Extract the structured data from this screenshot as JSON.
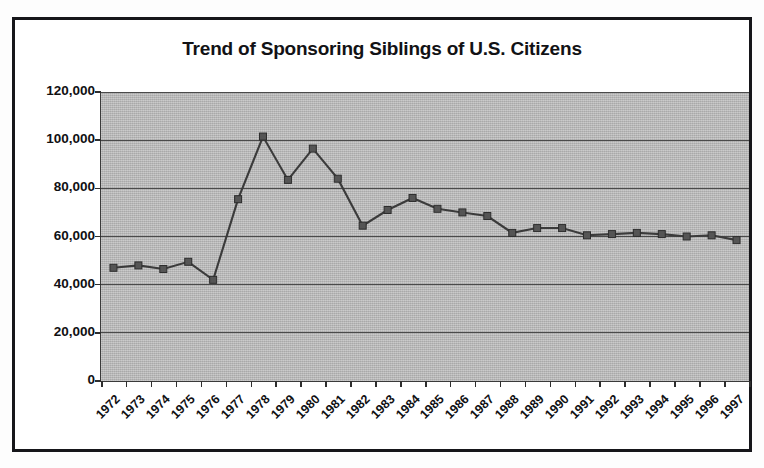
{
  "figure": {
    "title": "Trend of Sponsoring Siblings of U.S. Citizens"
  },
  "axes": {
    "y_tick_labels": [
      "120,000",
      "100,000",
      "80,000",
      "60,000",
      "40,000",
      "20,000",
      "0"
    ],
    "x_tick_labels": [
      "1972",
      "1973",
      "1974",
      "1975",
      "1976",
      "1977",
      "1978",
      "1979",
      "1980",
      "1981",
      "1982",
      "1983",
      "1984",
      "1985",
      "1986",
      "1987",
      "1988",
      "1989",
      "1990",
      "1991",
      "1992",
      "1993",
      "1994",
      "1995",
      "1996",
      "1997"
    ]
  },
  "chart_data": {
    "type": "line",
    "title": "Trend of Sponsoring Siblings of U.S. Citizens",
    "xlabel": "",
    "ylabel": "",
    "ylim": [
      0,
      120000
    ],
    "ytick_step": 20000,
    "grid": true,
    "legend": false,
    "marker": "square",
    "line_color": "#3b3b3b",
    "marker_color": "#555555",
    "plot_background": "#b9b9b9",
    "categories": [
      "1972",
      "1973",
      "1974",
      "1975",
      "1976",
      "1977",
      "1978",
      "1979",
      "1980",
      "1981",
      "1982",
      "1983",
      "1984",
      "1985",
      "1986",
      "1987",
      "1988",
      "1989",
      "1990",
      "1991",
      "1992",
      "1993",
      "1994",
      "1995",
      "1996",
      "1997"
    ],
    "values": [
      47000,
      48000,
      46500,
      49500,
      42000,
      75500,
      101500,
      83500,
      96500,
      84000,
      64500,
      71000,
      76000,
      71500,
      70000,
      68500,
      61500,
      63500,
      63500,
      60500,
      61000,
      61500,
      61000,
      60000,
      60500,
      58500
    ],
    "series": [
      {
        "name": "Sponsoring Siblings of U.S. Citizens",
        "values": [
          47000,
          48000,
          46500,
          49500,
          42000,
          75500,
          101500,
          83500,
          96500,
          84000,
          64500,
          71000,
          76000,
          71500,
          70000,
          68500,
          61500,
          63500,
          63500,
          60500,
          61000,
          61500,
          61000,
          60000,
          60500,
          58500
        ]
      }
    ]
  }
}
